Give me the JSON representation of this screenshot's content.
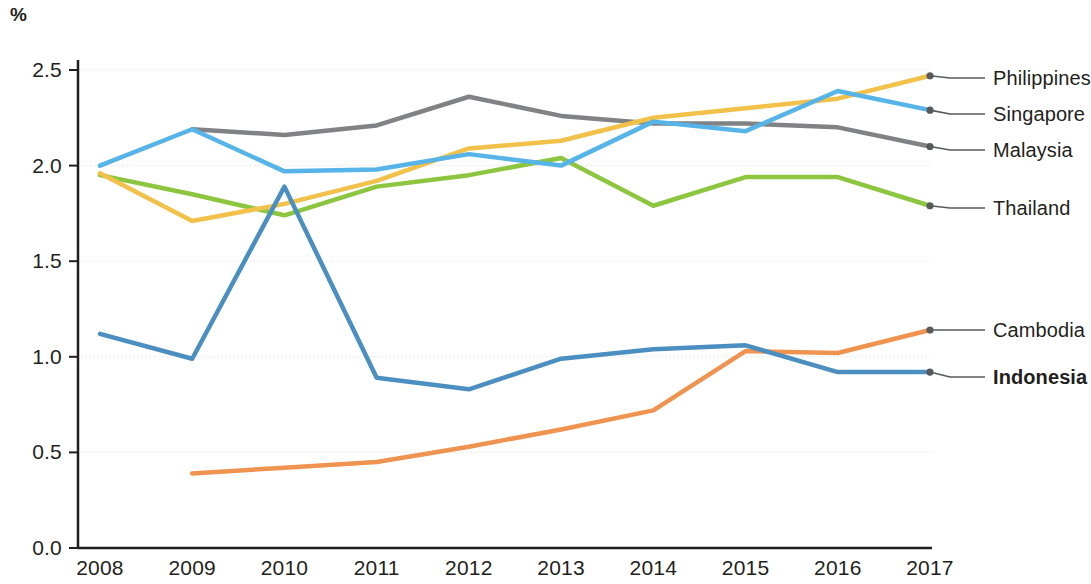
{
  "axis": {
    "unit_label": "%",
    "y_ticks": [
      "0.0",
      "0.5",
      "1.0",
      "1.5",
      "2.0",
      "2.5"
    ],
    "x_ticks": [
      "2008",
      "2009",
      "2010",
      "2011",
      "2012",
      "2013",
      "2014",
      "2015",
      "2016",
      "2017"
    ]
  },
  "labels": {
    "philippines": "Philippines",
    "singapore": "Singapore",
    "malaysia": "Malaysia",
    "thailand": "Thailand",
    "cambodia": "Cambodia",
    "indonesia": "Indonesia"
  },
  "colors": {
    "philippines": "#f2c14a",
    "singapore": "#56b4e8",
    "malaysia": "#808285",
    "thailand": "#8cc63f",
    "cambodia": "#ef9350",
    "indonesia": "#4a8fc0",
    "axis": "#231f20",
    "grid": "#d9d9d9",
    "leader": "#58595b"
  },
  "chart_data": {
    "type": "line",
    "title": "",
    "xlabel": "",
    "ylabel": "%",
    "x": [
      2008,
      2009,
      2010,
      2011,
      2012,
      2013,
      2014,
      2015,
      2016,
      2017
    ],
    "ylim": [
      0.0,
      2.5
    ],
    "xlim": [
      2008,
      2017
    ],
    "grid": true,
    "legend_position": "right-end-labels",
    "series": [
      {
        "name": "Philippines",
        "color": "#f2c14a",
        "values": [
          1.96,
          1.71,
          1.8,
          1.92,
          2.09,
          2.13,
          2.25,
          2.3,
          2.35,
          2.47
        ]
      },
      {
        "name": "Singapore",
        "color": "#56b4e8",
        "values": [
          2.0,
          2.19,
          1.97,
          1.98,
          2.06,
          2.0,
          2.23,
          2.18,
          2.39,
          2.29
        ]
      },
      {
        "name": "Malaysia",
        "color": "#808285",
        "values": [
          null,
          2.19,
          2.16,
          2.21,
          2.36,
          2.26,
          2.22,
          2.22,
          2.2,
          2.1
        ]
      },
      {
        "name": "Thailand",
        "color": "#8cc63f",
        "values": [
          1.95,
          1.85,
          1.74,
          1.89,
          1.95,
          2.04,
          1.79,
          1.94,
          1.94,
          1.79
        ]
      },
      {
        "name": "Cambodia",
        "color": "#ef9350",
        "values": [
          null,
          0.39,
          0.42,
          0.45,
          0.53,
          0.62,
          0.72,
          1.03,
          1.02,
          1.14
        ]
      },
      {
        "name": "Indonesia",
        "color": "#4a8fc0",
        "values": [
          1.12,
          0.99,
          1.89,
          0.89,
          0.83,
          0.99,
          1.04,
          1.06,
          0.92,
          0.92
        ]
      }
    ]
  }
}
